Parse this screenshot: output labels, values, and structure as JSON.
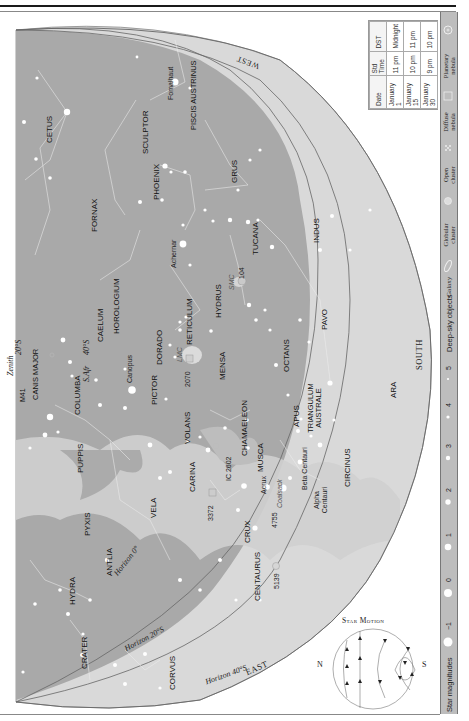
{
  "chart": {
    "directions": {
      "west": "WEST",
      "south": "SOUTH",
      "east": "EAST"
    },
    "zenith": {
      "label": "Zenith",
      "latitude": "20°S"
    },
    "zenith_secondary": {
      "label": "S.Afr",
      "latitude": "40°S"
    },
    "horizons": [
      {
        "label": "Horizon 0°"
      },
      {
        "label": "Horizon 20°S"
      },
      {
        "label": "Horizon 40°S"
      }
    ],
    "constellations": [
      "CETUS",
      "SCULPTOR",
      "PISCIS AUSTRINUS",
      "GRUS",
      "PHOENIX",
      "FORNAX",
      "TUCANA",
      "INDUS",
      "HOROLOGIUM",
      "CAELUM",
      "HYDRUS",
      "RETICULUM",
      "DORADO",
      "PICTOR",
      "MENSA",
      "OCTANS",
      "PAVO",
      "COLUMBA",
      "CANIS MAJOR",
      "PUPPIS",
      "VOLANS",
      "CHAMAELEON",
      "APUS",
      "TRIANGULUM AUSTRALE",
      "ARA",
      "CARINA",
      "MUSCA",
      "CIRCINUS",
      "VELA",
      "PYXIS",
      "ANTLIA",
      "CRUX",
      "CENTAURUS",
      "HYDRA",
      "CRATER",
      "CORVUS"
    ],
    "stars": [
      "Fomalhaut",
      "Achernar",
      "Canopus",
      "Acrux",
      "Beta Centauri",
      "Alpha Centauri"
    ],
    "deep_sky": [
      "SMC",
      "104",
      "LMC",
      "2070",
      "M41",
      "IC 2602",
      "3372",
      "4755",
      "Coalsack",
      "5139"
    ]
  },
  "time_table": {
    "headers": [
      "Date",
      "Std Time",
      "DST"
    ],
    "rows": [
      [
        "January 1",
        "11 pm",
        "Midnight"
      ],
      [
        "January 15",
        "10 pm",
        "11 pm"
      ],
      [
        "January 30",
        "9 pm",
        "10 pm"
      ]
    ]
  },
  "legend": {
    "deep_sky_title": "Deep-sky objects",
    "deep_sky_items": [
      {
        "label": "Galaxy",
        "icon": "galaxy-icon"
      },
      {
        "label": "Globular cluster",
        "icon": "globular-cluster-icon"
      },
      {
        "label": "Open cluster",
        "icon": "open-cluster-icon"
      },
      {
        "label": "Diffuse nebula",
        "icon": "diffuse-nebula-icon"
      },
      {
        "label": "Planetary nebula",
        "icon": "planetary-nebula-icon"
      }
    ],
    "magnitudes_title": "Star magnitudes",
    "magnitudes": [
      "−1",
      "0",
      "1",
      "2",
      "3",
      "4",
      "5"
    ]
  },
  "star_motion": {
    "title": "Star Motion",
    "north": "N",
    "south": "S"
  }
}
